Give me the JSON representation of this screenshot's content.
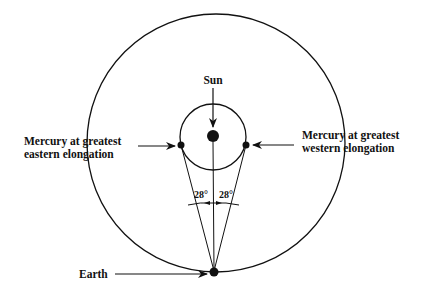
{
  "diagram": {
    "labels": {
      "sun": "Sun",
      "east_line1": "Mercury at greatest",
      "east_line2": "eastern   elongation",
      "west_line1": "Mercury at greatest",
      "west_line2": "western   elongation",
      "earth": "Earth",
      "angle_left": "28°",
      "angle_right": "28°"
    },
    "colors": {
      "ink": "#111111",
      "background": "#ffffff"
    }
  }
}
